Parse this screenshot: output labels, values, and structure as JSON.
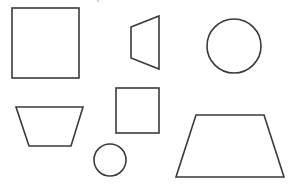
{
  "canvas": {
    "width": 298,
    "height": 188,
    "background": "#ffffff",
    "stroke_color": "#3a3a3a"
  },
  "shapes": [
    {
      "id": "large-square",
      "type": "rect",
      "x": 12,
      "y": 8,
      "width": 67,
      "height": 70
    },
    {
      "id": "narrow-trapezoid",
      "type": "polygon",
      "points": "131,27 159,16 159,69 131,58"
    },
    {
      "id": "large-circle",
      "type": "circle",
      "cx": 234,
      "cy": 46,
      "r": 27
    },
    {
      "id": "left-trapezoid",
      "type": "polygon",
      "points": "16,107 83,107 71,146 29,146"
    },
    {
      "id": "small-square",
      "type": "rect",
      "x": 116,
      "y": 88,
      "width": 43,
      "height": 45
    },
    {
      "id": "small-circle",
      "type": "circle",
      "cx": 110,
      "cy": 160,
      "r": 16
    },
    {
      "id": "large-trapezoid",
      "type": "polygon",
      "points": "196,115 264,115 284,177 176,177"
    }
  ],
  "marks": [
    {
      "id": "stray-dot",
      "cx": 98,
      "cy": 1,
      "r": 0.8
    }
  ]
}
